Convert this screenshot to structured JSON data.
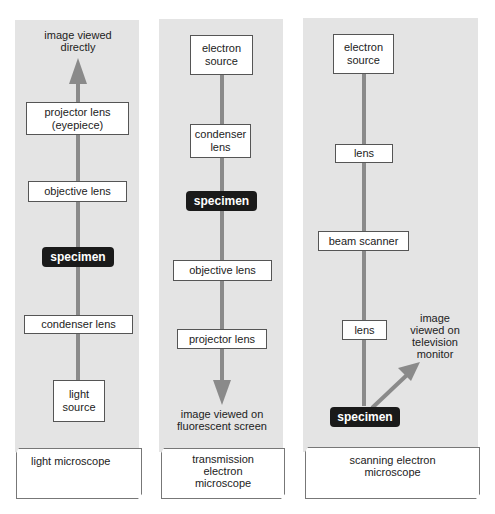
{
  "colors": {
    "panel": "#e4e4e4",
    "beam": "#8a8a8a",
    "specimen_bg": "#1a1a1a",
    "box_bg": "#ffffff"
  },
  "light_microscope": {
    "title": "light microscope",
    "output": "image viewed\ndirectly",
    "components": [
      "projector lens\n(eyepiece)",
      "objective lens",
      "specimen",
      "condenser lens",
      "light\nsource"
    ]
  },
  "transmission_electron_microscope": {
    "title": "transmission\nelectron\nmicroscope",
    "output": "image viewed on\nfluorescent screen",
    "components": [
      "electron\nsource",
      "condenser\nlens",
      "specimen",
      "objective lens",
      "projector lens"
    ]
  },
  "scanning_electron_microscope": {
    "title": "scanning electron\nmicroscope",
    "output": "image\nviewed on\ntelevision\nmonitor",
    "components": [
      "electron\nsource",
      "lens",
      "beam scanner",
      "lens",
      "specimen"
    ]
  }
}
